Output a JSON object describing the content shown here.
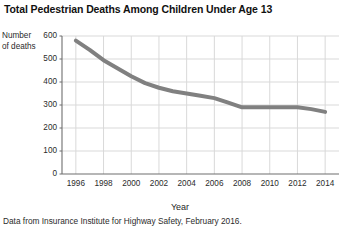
{
  "title": "Total Pedestrian Deaths Among Children Under Age 13",
  "ylabel_line1": "Number",
  "ylabel_line2": "of deaths",
  "xlabel": "Year",
  "source_note": "Data from Insurance Institute for Highway Safety, February 2016.",
  "colors": {
    "line": "#808080",
    "grid": "#d9d9d9",
    "axis": "#6e6e6e",
    "text": "#2b2b2b",
    "background": "#ffffff"
  },
  "chart_data": {
    "type": "line",
    "title": "Total Pedestrian Deaths Among Children Under Age 13",
    "xlabel": "Year",
    "ylabel": "Number of deaths",
    "x": [
      1996,
      1997,
      1998,
      1999,
      2000,
      2001,
      2002,
      2003,
      2004,
      2005,
      2006,
      2007,
      2008,
      2009,
      2010,
      2011,
      2012,
      2013,
      2014
    ],
    "series": [
      {
        "name": "Pedestrian deaths",
        "values": [
          580,
          540,
          495,
          460,
          425,
          395,
          375,
          360,
          350,
          340,
          330,
          310,
          290,
          290,
          290,
          290,
          290,
          282,
          270
        ]
      }
    ],
    "xticks": [
      1996,
      1998,
      2000,
      2002,
      2004,
      2006,
      2008,
      2010,
      2012,
      2014
    ],
    "xtick_labels": [
      "1996",
      "1998",
      "2000",
      "2002",
      "2004",
      "2006",
      "2008",
      "2010",
      "2012",
      "2014"
    ],
    "yticks": [
      0,
      100,
      200,
      300,
      400,
      500,
      600
    ],
    "ytick_labels": [
      "0",
      "100",
      "200",
      "300",
      "400",
      "500",
      "600"
    ],
    "xlim": [
      1995,
      2015
    ],
    "ylim": [
      0,
      600
    ],
    "grid": true,
    "legend": false,
    "line_color": "#808080",
    "line_width": 4
  }
}
